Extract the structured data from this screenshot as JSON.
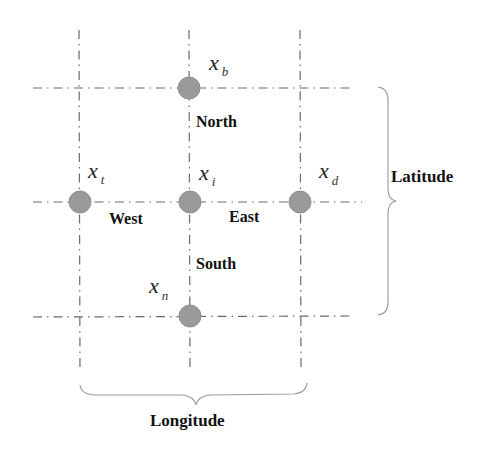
{
  "diagram": {
    "type": "grid-neighborhood",
    "nodes": [
      {
        "id": "center",
        "var": "x",
        "sub": "i"
      },
      {
        "id": "north",
        "var": "x",
        "sub": "b"
      },
      {
        "id": "west",
        "var": "x",
        "sub": "t"
      },
      {
        "id": "east",
        "var": "x",
        "sub": "d"
      },
      {
        "id": "south",
        "var": "x",
        "sub": "n"
      }
    ],
    "directions": {
      "north": "North",
      "south": "South",
      "west": "West",
      "east": "East"
    },
    "axes": {
      "latitude": "Latitude",
      "longitude": "Longitude"
    },
    "colors": {
      "node": "#9a9a9a",
      "line": "#6a6a6a",
      "brace": "#9a9a9a",
      "text": "#111111"
    }
  }
}
